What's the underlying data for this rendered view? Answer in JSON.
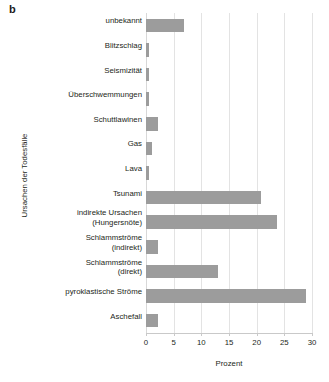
{
  "panel": {
    "letter": "b"
  },
  "chart_data": {
    "type": "bar",
    "orientation": "horizontal",
    "title": "",
    "xlabel": "Prozent",
    "ylabel": "Ursachen der Todesfälle",
    "xlim": [
      0,
      30
    ],
    "ylim": null,
    "grid": "vertical",
    "legend": null,
    "bar_color": "#9c9c9c",
    "background_color": "#ffffff",
    "gridline_color": "#e3e3e3",
    "xticks": [
      0,
      5,
      10,
      15,
      20,
      25,
      30
    ],
    "xticklabels": [
      "0",
      "5",
      "10",
      "15",
      "20",
      "25",
      "30"
    ],
    "categories": [
      "unbekannt",
      "Blitzschlag",
      "Seismizität",
      "Überschwemmungen",
      "Schuttlawinen",
      "Gas",
      "Lava",
      "Tsunami",
      "indirekte Ursachen (Hungersnöte)",
      "Schlammströme (indirekt)",
      "Schlammströme (direkt)",
      "pyroklastische Ströme",
      "Aschefall"
    ],
    "category_lines": [
      [
        "unbekannt"
      ],
      [
        "Blitzschlag"
      ],
      [
        "Seismizität"
      ],
      [
        "Überschwemmungen"
      ],
      [
        "Schuttlawinen"
      ],
      [
        "Gas"
      ],
      [
        "Lava"
      ],
      [
        "Tsunami"
      ],
      [
        "indirekte Ursachen",
        "(Hungersnöte)"
      ],
      [
        "Schlammströme",
        "(indirekt)"
      ],
      [
        "Schlammströme",
        "(direkt)"
      ],
      [
        "pyroklastische Ströme"
      ],
      [
        "Aschefall"
      ]
    ],
    "values": [
      6.8,
      0.5,
      0.5,
      0.5,
      2.2,
      1.0,
      0.5,
      20.7,
      23.6,
      2.2,
      13.1,
      29.0,
      2.2
    ]
  }
}
